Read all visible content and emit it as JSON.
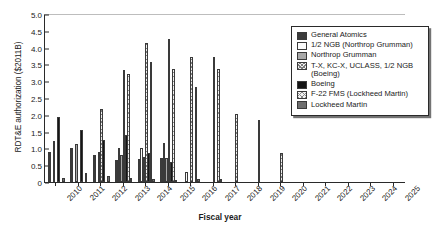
{
  "chart_data": {
    "type": "bar",
    "title": "",
    "xlabel": "Fiscal year",
    "ylabel": "RDT&E authorization ($2011B)",
    "ylim": [
      0,
      5.0
    ],
    "ytick_values": [
      "0",
      "0.5",
      "1.0",
      "1.5",
      "2.0",
      "2.5",
      "3.0",
      "3.5",
      "4.0",
      "4.5",
      "5.0"
    ],
    "grid": false,
    "legend_position": "top-right",
    "categories": [
      "2010",
      "2011",
      "2012",
      "2013",
      "2014",
      "2015",
      "2016",
      "2017",
      "2018",
      "2019",
      "2020",
      "2021",
      "2022",
      "2023",
      "2024",
      "2025"
    ],
    "series": [
      {
        "name": "General Atomics",
        "swatch": "dark-grey",
        "values": [
          0.88,
          1.0,
          0.8,
          0.67,
          0.68,
          0.7,
          0,
          0,
          0,
          0,
          0,
          0,
          0,
          0,
          0,
          0
        ]
      },
      {
        "name": "1/2 NGB (Northrop Grumman)",
        "swatch": "light-dotted",
        "values": [
          0,
          0,
          0,
          1.0,
          1.0,
          1.17,
          0.3,
          0,
          0,
          0,
          0,
          0,
          0,
          0,
          0,
          0
        ]
      },
      {
        "name": "Northrop Grumman",
        "swatch": "mid-grey",
        "values": [
          1.21,
          1.12,
          0.88,
          0.79,
          0.75,
          0.72,
          0,
          0,
          0,
          0,
          0,
          0,
          0,
          0,
          0,
          0
        ]
      },
      {
        "name": "T-X, KC-X, UCLASS, 1/2 NGB (Boeing)",
        "swatch": "dense-checker",
        "values": [
          0,
          0,
          2.17,
          3.33,
          4.15,
          4.25,
          3.72,
          3.72,
          2.03,
          1.85,
          0.85,
          0,
          0,
          0,
          0,
          0
        ]
      },
      {
        "name": "Boeing",
        "swatch": "black",
        "values": [
          1.94,
          1.54,
          1.26,
          1.4,
          0.86,
          0.61,
          0,
          0,
          0,
          0,
          0,
          0,
          0,
          0,
          0,
          0
        ]
      },
      {
        "name": "F-22 FMS (Lockheed Martin)",
        "swatch": "light-crosshatch",
        "values": [
          0,
          0,
          0,
          3.2,
          3.57,
          3.35,
          2.83,
          3.37,
          0,
          0,
          0,
          0,
          0,
          0,
          0,
          0
        ]
      },
      {
        "name": "Lockheed Martin",
        "swatch": "grey",
        "values": [
          0.13,
          0.27,
          0.18,
          0.12,
          0.09,
          0.05,
          0.1,
          0.09,
          0,
          0,
          0,
          0,
          0,
          0,
          0,
          0
        ]
      }
    ]
  },
  "legend": {
    "items": [
      {
        "label": "General Atomics"
      },
      {
        "label": "1/2 NGB (Northrop Grumman)"
      },
      {
        "label": "Northrop Grumman"
      },
      {
        "label": "T-X, KC-X, UCLASS, 1/2 NGB (Boeing)"
      },
      {
        "label": "Boeing"
      },
      {
        "label": "F-22 FMS (Lockheed Martin)"
      },
      {
        "label": "Lockheed Martin"
      }
    ]
  }
}
